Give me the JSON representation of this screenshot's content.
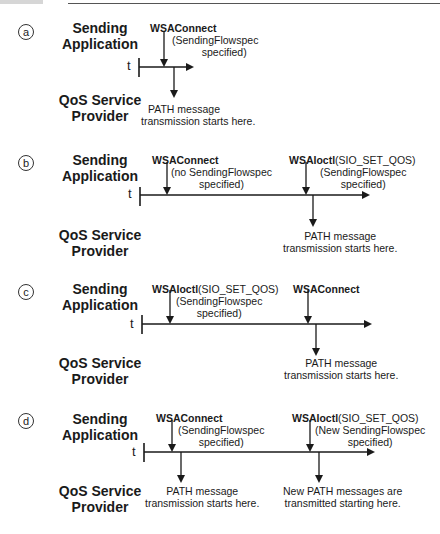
{
  "roles": {
    "app_line1": "Sending",
    "app_line2": "Application",
    "qos_line1": "QoS Service",
    "qos_line2": "Provider",
    "time_axis": "t"
  },
  "panels": [
    {
      "letter": "a",
      "app_events": [
        {
          "call": "WSAConnect",
          "args": "",
          "note1": "(SendingFlowspec",
          "note2": "specified)"
        }
      ],
      "provider_events": [
        {
          "line1": "PATH message",
          "line2": "transmission starts here."
        }
      ]
    },
    {
      "letter": "b",
      "app_events": [
        {
          "call": "WSAConnect",
          "args": "",
          "note1": "(no SendingFlowspec",
          "note2": "specified)"
        },
        {
          "call": "WSAIoctl",
          "args": "(SIO_SET_QOS)",
          "note1": "(SendingFlowspec",
          "note2": "specified)"
        }
      ],
      "provider_events": [
        {
          "line1": "PATH message",
          "line2": "transmission starts here."
        }
      ]
    },
    {
      "letter": "c",
      "app_events": [
        {
          "call": "WSAIoctl",
          "args": "(SIO_SET_QOS)",
          "note1": "(SendingFlowspec",
          "note2": "specified)"
        },
        {
          "call": "WSAConnect",
          "args": "",
          "note1": "",
          "note2": ""
        }
      ],
      "provider_events": [
        {
          "line1": "PATH message",
          "line2": "transmission starts here."
        }
      ]
    },
    {
      "letter": "d",
      "app_events": [
        {
          "call": "WSAConnect",
          "args": "",
          "note1": "(SendingFlowspec",
          "note2": "specified)"
        },
        {
          "call": "WSAIoctl",
          "args": "(SIO_SET_QOS)",
          "note1": "(New SendingFlowspec",
          "note2": "specified)"
        }
      ],
      "provider_events": [
        {
          "line1": "PATH message",
          "line2": "transmission starts here."
        },
        {
          "line1": "New PATH messages are",
          "line2": "transmitted starting here."
        }
      ]
    }
  ],
  "colors": {
    "line": "#1a1a1a",
    "background": "#ffffff"
  }
}
